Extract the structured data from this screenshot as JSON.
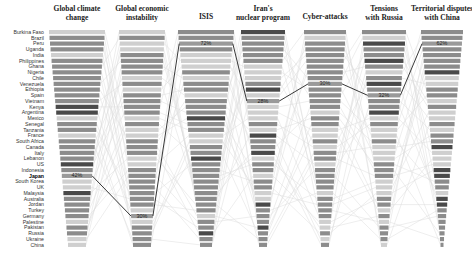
{
  "chart_data": {
    "type": "table",
    "title": "",
    "highlight_country": "Japan",
    "colors": {
      "bar_dark": "#4a4a4a",
      "bar_mid": "#8c8c8c",
      "bar_light": "#cfcfcf",
      "connector_light": "#dddddd",
      "connector_highlight": "#222222"
    },
    "countries": [
      "Burkina Faso",
      "Brazil",
      "Peru",
      "Uganda",
      "India",
      "Philippines",
      "Ghana",
      "Nigeria",
      "Chile",
      "Venezuela",
      "Ethiopia",
      "Spain",
      "Vietnam",
      "Kenya",
      "Argentina",
      "Mexico",
      "Senegal",
      "Tanzania",
      "France",
      "South Africa",
      "Canada",
      "Italy",
      "Lebanon",
      "US",
      "Indonesia",
      "Japan",
      "South Korea",
      "UK",
      "Malaysia",
      "Australia",
      "Jordan",
      "Turkey",
      "Germany",
      "Palestine",
      "Pakistan",
      "Russia",
      "Ukraine",
      "China"
    ],
    "columns": [
      {
        "title_lines": [
          "Global climate",
          "change"
        ],
        "highlight_rank": 26,
        "highlight_label": "42%"
      },
      {
        "title_lines": [
          "Global economic",
          "instability"
        ],
        "highlight_rank": 33,
        "highlight_label": "30%"
      },
      {
        "title_lines": [
          "ISIS"
        ],
        "highlight_rank": 3,
        "highlight_label": "72%"
      },
      {
        "title_lines": [
          "Iran's",
          "nuclear program"
        ],
        "highlight_rank": 13,
        "highlight_label": "28%"
      },
      {
        "title_lines": [
          "Cyber-attacks"
        ],
        "highlight_rank": 10,
        "highlight_label": "30%"
      },
      {
        "title_lines": [
          "Tensions",
          "with Russia"
        ],
        "highlight_rank": 12,
        "highlight_label": "32%"
      },
      {
        "title_lines": [
          "Territorial disputes",
          "with China"
        ],
        "highlight_rank": 3,
        "highlight_label": "62%"
      }
    ]
  }
}
